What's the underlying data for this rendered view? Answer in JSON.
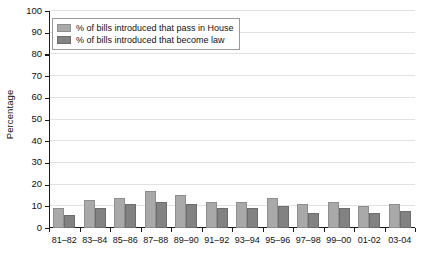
{
  "chart_data": {
    "type": "bar",
    "title": "",
    "xlabel": "",
    "ylabel": "Percentage",
    "ylim": [
      0,
      100
    ],
    "yticks": [
      0,
      10,
      20,
      30,
      40,
      50,
      60,
      70,
      80,
      90,
      100
    ],
    "grid": true,
    "legend_position": "top-left",
    "categories": [
      "81–82",
      "83–84",
      "85–86",
      "87–88",
      "89–90",
      "91–92",
      "93–94",
      "95–96",
      "97–98",
      "99–00",
      "01-02",
      "03-04"
    ],
    "series": [
      {
        "name": "% of bills introduced that pass in House",
        "color": "#a9a9a9",
        "values": [
          9,
          13,
          14,
          17,
          15,
          12,
          12,
          14,
          11,
          12,
          10,
          11
        ]
      },
      {
        "name": "% of bills introduced that become law",
        "color": "#828282",
        "values": [
          6,
          9,
          11,
          12,
          11,
          9,
          9,
          10,
          7,
          9,
          7,
          8
        ]
      }
    ]
  },
  "legend": {
    "items": [
      {
        "label": "% of bills introduced that pass in House",
        "swatch": "light"
      },
      {
        "label": "% of bills introduced that become law",
        "swatch": "dark"
      }
    ]
  },
  "axis": {
    "y_title": "Percentage"
  },
  "colors": {
    "series_light": "#a9a9a9",
    "series_dark": "#828282",
    "axis": "#1a1a1a",
    "gridline": "#e2e2e2",
    "background": "#ffffff"
  }
}
